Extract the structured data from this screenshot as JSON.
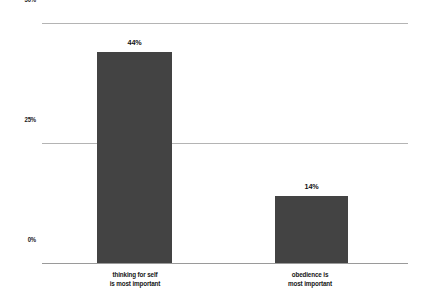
{
  "chart_data": {
    "type": "bar",
    "title": "",
    "subtitle": "",
    "xlabel": "",
    "ylabel": "",
    "categories": [
      "thinking for self is most important",
      "obedience is most important"
    ],
    "category_lines": [
      [
        "thinking for self",
        "is most important"
      ],
      [
        "obedience is",
        "most important"
      ]
    ],
    "values": [
      44,
      14
    ],
    "value_labels": [
      "44%",
      "14%"
    ],
    "ylim": [
      0,
      50
    ],
    "yticks": [
      0,
      25,
      50
    ],
    "ytick_labels": [
      "0%",
      "25%",
      "50%"
    ],
    "grid": true,
    "legend": "none",
    "colors": {
      "bar": "#434343",
      "gridline": "#b4b4b4",
      "baseline": "#9a9a9a",
      "text": "#111111",
      "background": "#ffffff"
    }
  },
  "axis": {
    "y_tick_50": "50%",
    "y_tick_25": "25%",
    "y_tick_0": "0%"
  },
  "bars": {
    "bar0_value_label": "44%",
    "bar1_value_label": "14%",
    "bar0_line1": "thinking for self",
    "bar0_line2": "is most important",
    "bar1_line1": "obedience is",
    "bar1_line2": "most important"
  }
}
